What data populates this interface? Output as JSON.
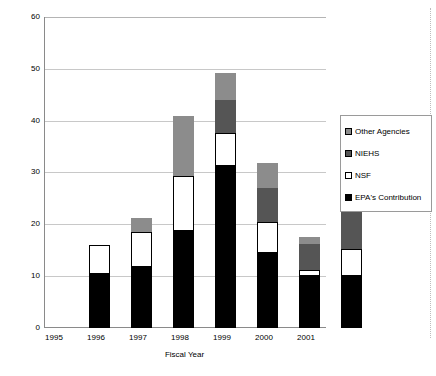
{
  "chart_data": {
    "type": "bar",
    "title": "",
    "xlabel": "Fiscal Year",
    "ylabel": "$ Millions",
    "categories": [
      "1995",
      "1996",
      "1997",
      "1998",
      "1999",
      "2000",
      "2001"
    ],
    "ylim": [
      0,
      60
    ],
    "yticks": [
      0,
      10,
      20,
      30,
      40,
      50,
      60
    ],
    "grid": true,
    "stacked": true,
    "legend_position": "right",
    "series": [
      {
        "name": "EPA's Contribution",
        "color": "#000000",
        "values": [
          10.4,
          11.8,
          18.8,
          31.3,
          14.5,
          10.1,
          10.0
        ]
      },
      {
        "name": "NSF",
        "color": "#ffffff",
        "values": [
          5.6,
          6.7,
          10.6,
          6.4,
          6.0,
          1.1,
          5.3
        ]
      },
      {
        "name": "NIEHS",
        "color": "#555555",
        "values": [
          0,
          0,
          0,
          6.5,
          6.6,
          5.1,
          8.9
        ]
      },
      {
        "name": "Other Agencies",
        "color": "#8c8c8c",
        "values": [
          0,
          2.8,
          11.7,
          5.1,
          4.8,
          1.3,
          0.4
        ]
      }
    ],
    "totals": [
      16.0,
      21.3,
      41.1,
      49.3,
      31.9,
      17.6,
      24.6
    ]
  },
  "legend": {
    "items": [
      {
        "label": "Other Agencies",
        "swatch": "other-agencies-swatch"
      },
      {
        "label": "NIEHS",
        "swatch": "niehs-swatch"
      },
      {
        "label": "NSF",
        "swatch": "nsf-swatch"
      },
      {
        "label": "EPA's Contribution",
        "swatch": "epa-contribution-swatch"
      }
    ]
  }
}
